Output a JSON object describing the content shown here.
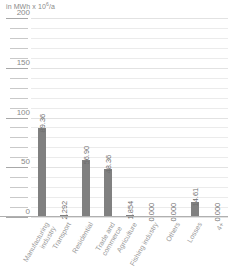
{
  "chart_data": {
    "type": "bar",
    "title": "",
    "subtitle": "",
    "unit_caption_prefix": "in MWh x 10",
    "unit_caption_exponent": "6",
    "unit_caption_suffix": "/a",
    "xlabel": "",
    "ylabel": "in MWh x 10^6/a",
    "ylim": [
      0,
      200
    ],
    "y_major_ticks": [
      0,
      50,
      100,
      150,
      200
    ],
    "y_minor_step": 10,
    "grid": true,
    "legend": "none",
    "bar_color": "#808080",
    "grid_color": "#ebebeb",
    "axis_color": "#b0b0b0",
    "text_color": "#8a8a8a",
    "categories": [
      "Manufacturing industry",
      "Transport",
      "Residential",
      "Trade and commerce",
      "Agriculture",
      "Fishing industry",
      "Others",
      "Losses",
      "4+"
    ],
    "category_lines": [
      [
        "Manufacturing",
        "industry"
      ],
      [
        "Transport",
        ""
      ],
      [
        "Residential",
        ""
      ],
      [
        "Trade and",
        "commerce"
      ],
      [
        "Agriculture",
        ""
      ],
      [
        "Fishing industry",
        ""
      ],
      [
        "Others",
        ""
      ],
      [
        "Losses",
        ""
      ],
      [
        "4+",
        ""
      ]
    ],
    "values": [
      89.36,
      2.292,
      56.9,
      48.36,
      1.854,
      0.0,
      0.0,
      14.61,
      0.0
    ],
    "value_labels": [
      "89.36",
      "2.292",
      "56.90",
      "48.36",
      "1.854",
      "0.000",
      "0.000",
      "14.61",
      "0.000"
    ]
  }
}
